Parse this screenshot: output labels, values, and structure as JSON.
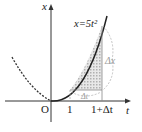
{
  "diagram": {
    "axes": {
      "x_label": "x",
      "t_label": "t",
      "origin_label": "O"
    },
    "curve_label": "x=5t²",
    "ticks": [
      "1",
      "1+Δt"
    ],
    "delta_t_label": "Δt",
    "delta_x_label": "Δx",
    "colors": {
      "curve": "#222222",
      "axis": "#333333",
      "shade": "#bbbbbb",
      "annotation": "#999999"
    }
  }
}
